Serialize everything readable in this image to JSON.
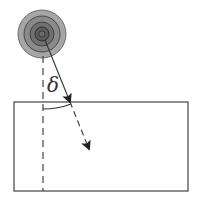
{
  "diagram": {
    "labels": {
      "angle": "δ"
    },
    "elements": {
      "source": {
        "type": "concentric-circles",
        "cx": 42,
        "cy": 34,
        "radius": 24,
        "rings": 4
      },
      "normal_line": {
        "type": "dashed-vertical",
        "x": 43,
        "y1": 56,
        "y2": 190
      },
      "incident_ray": {
        "type": "solid-arrow",
        "from": [
          45,
          40
        ],
        "to": [
          70,
          102
        ]
      },
      "refracted_ray": {
        "type": "dashed-arrow",
        "from": [
          70,
          102
        ],
        "to": [
          89,
          149
        ]
      },
      "medium": {
        "type": "rectangle",
        "x": 14,
        "y": 102,
        "width": 174,
        "height": 89
      },
      "angle_arc": {
        "type": "arc",
        "from": [
          43,
          109
        ],
        "to": [
          71,
          104
        ]
      }
    },
    "colors": {
      "stroke": "#333333",
      "ring_outer": "#9a9a9a",
      "ring_mid": "#7d7d7d",
      "ring_inner": "#5e5e5e",
      "ring_core": "#4a4a4a"
    }
  }
}
